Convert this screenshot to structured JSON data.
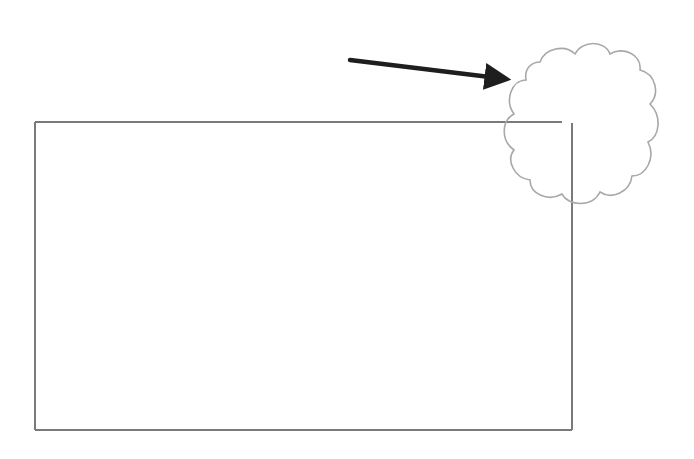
{
  "diagram": {
    "colors": {
      "background": "#ffffff",
      "rectangle_stroke": "#7a7a7a",
      "cloud_stroke": "#a0a0a0",
      "arrow": "#1e1e1e"
    },
    "shapes": [
      {
        "type": "rectangle",
        "label": ""
      },
      {
        "type": "cloud",
        "label": ""
      },
      {
        "type": "arrow",
        "label": ""
      }
    ]
  }
}
